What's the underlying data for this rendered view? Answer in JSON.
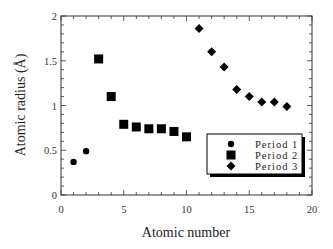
{
  "chart_data": {
    "type": "scatter",
    "title": "",
    "xlabel": "Atomic number",
    "ylabel": "Atomic radius (Å)",
    "xlim": [
      0,
      20
    ],
    "ylim": [
      0,
      2
    ],
    "xticks": [
      0,
      5,
      10,
      15,
      20
    ],
    "yticks": [
      0,
      0.5,
      1,
      1.5,
      2
    ],
    "xtick_labels": [
      "0",
      "5",
      "10",
      "15",
      "20"
    ],
    "ytick_labels": [
      "0",
      "0.5",
      "1",
      "1.5",
      "2"
    ],
    "grid": false,
    "legend_position": "lower right",
    "series": [
      {
        "name": "Period 1",
        "marker": "circle",
        "x": [
          1,
          2
        ],
        "y": [
          0.37,
          0.49
        ]
      },
      {
        "name": "Period 2",
        "marker": "square",
        "x": [
          3,
          4,
          5,
          6,
          7,
          8,
          9,
          10
        ],
        "y": [
          1.52,
          1.1,
          0.79,
          0.76,
          0.74,
          0.74,
          0.71,
          0.65
        ]
      },
      {
        "name": "Period 3",
        "marker": "diamond",
        "x": [
          11,
          12,
          13,
          14,
          15,
          16,
          17,
          18
        ],
        "y": [
          1.86,
          1.6,
          1.43,
          1.18,
          1.1,
          1.04,
          1.04,
          0.99
        ]
      }
    ]
  },
  "colors": {
    "marker": "#000000",
    "axis": "#333333",
    "background": "#ffffff"
  }
}
